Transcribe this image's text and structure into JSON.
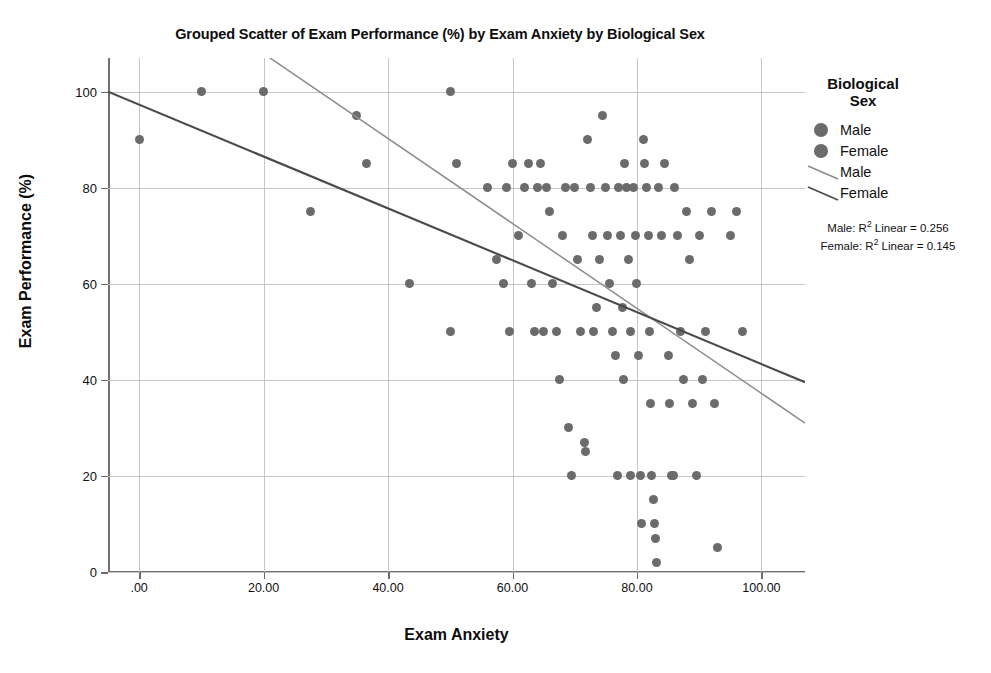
{
  "chart_data": {
    "type": "scatter",
    "title": "Grouped Scatter of Exam Performance (%) by Exam Anxiety by Biological Sex",
    "xlabel": "Exam Anxiety",
    "ylabel": "Exam Performance (%)",
    "xlim": [
      -5,
      107
    ],
    "ylim": [
      0,
      107
    ],
    "grid": true,
    "legend_position": "right",
    "xticks": [
      0,
      20,
      40,
      60,
      80,
      100
    ],
    "xtick_labels": [
      ".00",
      "20.00",
      "40.00",
      "60.00",
      "80.00",
      "100.00"
    ],
    "yticks": [
      0,
      20,
      40,
      60,
      80,
      100
    ],
    "ytick_labels": [
      "0",
      "20",
      "40",
      "60",
      "80",
      "100"
    ],
    "marker_color": "#6b6b6b",
    "series": [
      {
        "name": "Male",
        "marker_color": "#6b6b6b",
        "line_color": "#8c8c8c",
        "r2_linear": 0.256,
        "r2_label": "Male: R² Linear = 0.256",
        "fit_line": {
          "x0": 12.0,
          "y0": 115.0,
          "x1": 107.0,
          "y1": 31.0
        }
      },
      {
        "name": "Female",
        "marker_color": "#6b6b6b",
        "line_color": "#4a4a4a",
        "r2_linear": 0.145,
        "r2_label": "Female: R² Linear = 0.145",
        "fit_line": {
          "x0": -5.0,
          "y0": 100.0,
          "x1": 107.0,
          "y1": 39.5
        }
      }
    ],
    "points": [
      [
        0,
        90
      ],
      [
        10,
        100
      ],
      [
        20,
        100
      ],
      [
        27.5,
        75
      ],
      [
        35,
        95
      ],
      [
        36.5,
        85
      ],
      [
        43.5,
        60
      ],
      [
        50,
        100
      ],
      [
        50,
        50
      ],
      [
        51,
        85
      ],
      [
        56,
        80
      ],
      [
        57.5,
        65
      ],
      [
        58.5,
        60
      ],
      [
        59,
        80
      ],
      [
        59.5,
        50
      ],
      [
        60,
        85
      ],
      [
        61,
        70
      ],
      [
        62,
        80
      ],
      [
        62.5,
        85
      ],
      [
        63,
        60
      ],
      [
        63.5,
        50
      ],
      [
        64,
        80
      ],
      [
        64.5,
        85
      ],
      [
        65,
        50
      ],
      [
        65.5,
        80
      ],
      [
        66,
        75
      ],
      [
        66.5,
        60
      ],
      [
        67,
        50
      ],
      [
        67.5,
        40
      ],
      [
        68,
        70
      ],
      [
        68.5,
        80
      ],
      [
        69,
        30
      ],
      [
        69.5,
        20
      ],
      [
        70,
        80
      ],
      [
        70.5,
        65
      ],
      [
        71,
        50
      ],
      [
        71.5,
        27
      ],
      [
        71.7,
        25
      ],
      [
        72,
        90
      ],
      [
        72.5,
        80
      ],
      [
        72.8,
        70
      ],
      [
        73,
        50
      ],
      [
        73.5,
        55
      ],
      [
        74,
        65
      ],
      [
        74.5,
        95
      ],
      [
        75,
        80
      ],
      [
        75.3,
        70
      ],
      [
        75.6,
        60
      ],
      [
        76,
        50
      ],
      [
        76.5,
        45
      ],
      [
        76.8,
        20
      ],
      [
        77,
        80
      ],
      [
        77.3,
        70
      ],
      [
        77.6,
        55
      ],
      [
        77.8,
        40
      ],
      [
        78,
        85
      ],
      [
        78.3,
        80
      ],
      [
        78.6,
        65
      ],
      [
        78.9,
        50
      ],
      [
        79,
        20
      ],
      [
        79.5,
        80
      ],
      [
        79.8,
        70
      ],
      [
        80,
        60
      ],
      [
        80.3,
        45
      ],
      [
        80.5,
        20
      ],
      [
        80.8,
        10
      ],
      [
        81,
        90
      ],
      [
        81.2,
        85
      ],
      [
        81.5,
        80
      ],
      [
        81.8,
        70
      ],
      [
        82,
        50
      ],
      [
        82.2,
        35
      ],
      [
        82.4,
        20
      ],
      [
        82.6,
        15
      ],
      [
        82.8,
        10
      ],
      [
        83,
        7
      ],
      [
        83.2,
        2
      ],
      [
        83.5,
        80
      ],
      [
        84,
        70
      ],
      [
        84.5,
        85
      ],
      [
        85,
        45
      ],
      [
        85.3,
        35
      ],
      [
        85.6,
        20
      ],
      [
        85.8,
        20
      ],
      [
        86,
        80
      ],
      [
        86.5,
        70
      ],
      [
        87,
        50
      ],
      [
        87.5,
        40
      ],
      [
        88,
        75
      ],
      [
        88.5,
        65
      ],
      [
        89,
        35
      ],
      [
        89.5,
        20
      ],
      [
        90,
        70
      ],
      [
        90.5,
        40
      ],
      [
        91,
        50
      ],
      [
        92,
        75
      ],
      [
        92.5,
        35
      ],
      [
        93,
        5
      ],
      [
        95,
        70
      ],
      [
        96,
        75
      ],
      [
        97,
        50
      ]
    ]
  },
  "legend": {
    "title_line1": "Biological",
    "title_line2": "Sex",
    "marker_entries": [
      {
        "label": "Male"
      },
      {
        "label": "Female"
      }
    ],
    "line_entries": [
      {
        "label": "Male"
      },
      {
        "label": "Female"
      }
    ],
    "stats": [
      {
        "prefix": "Male: R",
        "sup": "2",
        "suffix": " Linear = 0.256"
      },
      {
        "prefix": "Female: R",
        "sup": "2",
        "suffix": " Linear = 0.145"
      }
    ]
  }
}
